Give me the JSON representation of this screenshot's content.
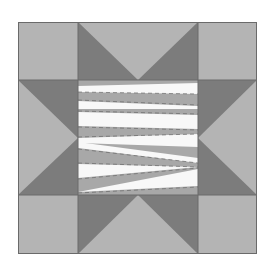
{
  "image": {
    "subject": "Sawtooth star quilt block (grayscale)",
    "width": 276,
    "height": 264
  },
  "colors": {
    "background": "#ffffff",
    "light": "#b4b4b4",
    "dark": "#7c7c7c",
    "white": "#f8f8f8",
    "stripe_gray": "#a8a8a8",
    "line": "#6a6a6a"
  },
  "block": {
    "outer": {
      "x": 18,
      "y": 22,
      "w": 239,
      "h": 232
    },
    "grid_x": [
      18,
      78,
      198,
      257
    ],
    "grid_y": [
      22,
      80,
      195,
      254
    ],
    "center": {
      "x": 78,
      "y": 80,
      "w": 120,
      "h": 115
    },
    "star_points": [
      "top",
      "right",
      "bottom",
      "left"
    ],
    "corners": [
      "top-left",
      "top-right",
      "bottom-left",
      "bottom-right"
    ]
  }
}
